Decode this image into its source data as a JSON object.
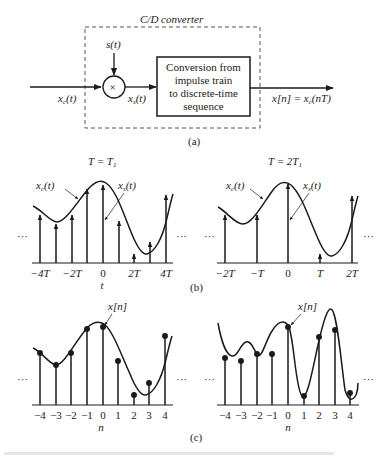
{
  "part_a": {
    "converter_title": "C/D converter",
    "multiplier_input_label": "s(t)",
    "multiplier_symbol": "×",
    "input_label": "x_c(t)",
    "input_label_main": "x",
    "input_label_sub": "c",
    "input_label_arg": "(t)",
    "intermediate_label_main": "x",
    "intermediate_label_sub": "s",
    "intermediate_label_arg": "(t)",
    "block_lines": [
      "Conversion from",
      "impulse train",
      "to discrete-time",
      "sequence"
    ],
    "output_label": "x[n] = x_c(nT)",
    "output_lhs": "x[n] = x",
    "output_sub": "c",
    "output_rhs": "(nT)",
    "caption": "(a)"
  },
  "part_b": {
    "caption": "(b)",
    "axis_var": "t",
    "left": {
      "title": "T = T1",
      "title_main": "T = T",
      "title_sub": "1",
      "curve_label": "x_c(t)",
      "samples_label": "x_s(t)",
      "ticks": [
        "−4T",
        "−2T",
        "0",
        "2T",
        "4T"
      ],
      "ellipsis": "···"
    },
    "right": {
      "title": "T = 2T1",
      "title_main": "T = 2T",
      "title_sub": "1",
      "curve_label": "x_c(t)",
      "samples_label": "x_s(t)",
      "ticks": [
        "−2T",
        "−T",
        "0",
        "T",
        "2T"
      ],
      "ellipsis": "···"
    }
  },
  "part_c": {
    "caption": "(c)",
    "axis_var": "n",
    "left": {
      "seq_label": "x[n]",
      "ticks": [
        "−4",
        "−3",
        "−2",
        "−1",
        "0",
        "1",
        "2",
        "3",
        "4"
      ],
      "ellipsis": "···"
    },
    "right": {
      "seq_label": "x[n]",
      "ticks": [
        "−4",
        "−3",
        "−2",
        "−1",
        "0",
        "1",
        "2",
        "3",
        "4"
      ],
      "ellipsis": "···"
    }
  },
  "colors": {
    "ink": "#1a1a1a",
    "dashed_border": "#555555",
    "background": "#ffffff"
  }
}
